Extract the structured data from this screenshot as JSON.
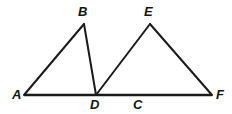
{
  "figure": {
    "kind": "geometry-diagram",
    "width": 232,
    "height": 114,
    "background_color": "#FFFFFF",
    "stroke_color": "#1A1A1A",
    "label_color": "#141414",
    "stroke_width": 2,
    "baseline_stroke_width": 2.6
  },
  "points": {
    "A": {
      "label": "A",
      "x": 24,
      "y": 95,
      "label_x": 12,
      "label_y": 88
    },
    "B": {
      "label": "B",
      "x": 84,
      "y": 24,
      "label_x": 78,
      "label_y": 5
    },
    "D": {
      "label": "D",
      "x": 96,
      "y": 95,
      "label_x": 90,
      "label_y": 98
    },
    "C": {
      "label": "C",
      "x": 138,
      "y": 95,
      "label_x": 133,
      "label_y": 98
    },
    "E": {
      "label": "E",
      "x": 150,
      "y": 24,
      "label_x": 144,
      "label_y": 5
    },
    "F": {
      "label": "F",
      "x": 212,
      "y": 95,
      "label_x": 216,
      "label_y": 88
    }
  },
  "segments": [
    {
      "name": "baseline-AF",
      "from": "A",
      "to": "F",
      "emphasis": "thick"
    },
    {
      "name": "side-AB",
      "from": "A",
      "to": "B",
      "emphasis": "normal"
    },
    {
      "name": "side-BD",
      "from": "B",
      "to": "D",
      "emphasis": "normal"
    },
    {
      "name": "side-DE",
      "from": "D",
      "to": "E",
      "emphasis": "normal"
    },
    {
      "name": "side-EF",
      "from": "E",
      "to": "F",
      "emphasis": "normal"
    }
  ],
  "triangles": [
    {
      "name": "triangle-ABD",
      "vertices": [
        "A",
        "B",
        "D"
      ]
    },
    {
      "name": "triangle-DEF",
      "vertices": [
        "D",
        "E",
        "F"
      ]
    }
  ],
  "labels": {
    "A": "A",
    "B": "B",
    "C": "C",
    "D": "D",
    "E": "E",
    "F": "F"
  }
}
